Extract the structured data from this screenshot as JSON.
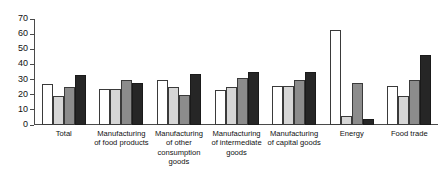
{
  "chart_data": {
    "type": "bar",
    "title": "",
    "subtitle": "",
    "xlabel": "",
    "ylabel": "",
    "ylim": [
      0,
      70
    ],
    "yticks": [
      0,
      10,
      20,
      30,
      40,
      50,
      60,
      70
    ],
    "grid": false,
    "legend": "none",
    "categories": [
      "Total",
      "Manufacturing of food products",
      "Manufacturing of other consumption goods",
      "Manufacturing of intermediate goods",
      "Manufacturing of capital goods",
      "Energy",
      "Food trade"
    ],
    "series": [
      {
        "name": "series-1",
        "color": "#ffffff",
        "values": [
          27,
          24,
          30,
          23,
          26,
          63,
          26
        ]
      },
      {
        "name": "series-2",
        "color": "#d6d6d6",
        "values": [
          19,
          24,
          25,
          25,
          26,
          6,
          19
        ]
      },
      {
        "name": "series-3",
        "color": "#8c8c8c",
        "values": [
          25,
          30,
          20,
          31,
          30,
          28,
          30
        ]
      },
      {
        "name": "series-4",
        "color": "#262626",
        "values": [
          33,
          28,
          34,
          35,
          35,
          4,
          46
        ]
      }
    ]
  },
  "axis": {
    "tick_labels": [
      "0",
      "10",
      "20",
      "30",
      "40",
      "50",
      "60",
      "70"
    ]
  },
  "colors": {
    "axis": "#4a4a4a",
    "text": "#111111",
    "background": "#ffffff"
  }
}
